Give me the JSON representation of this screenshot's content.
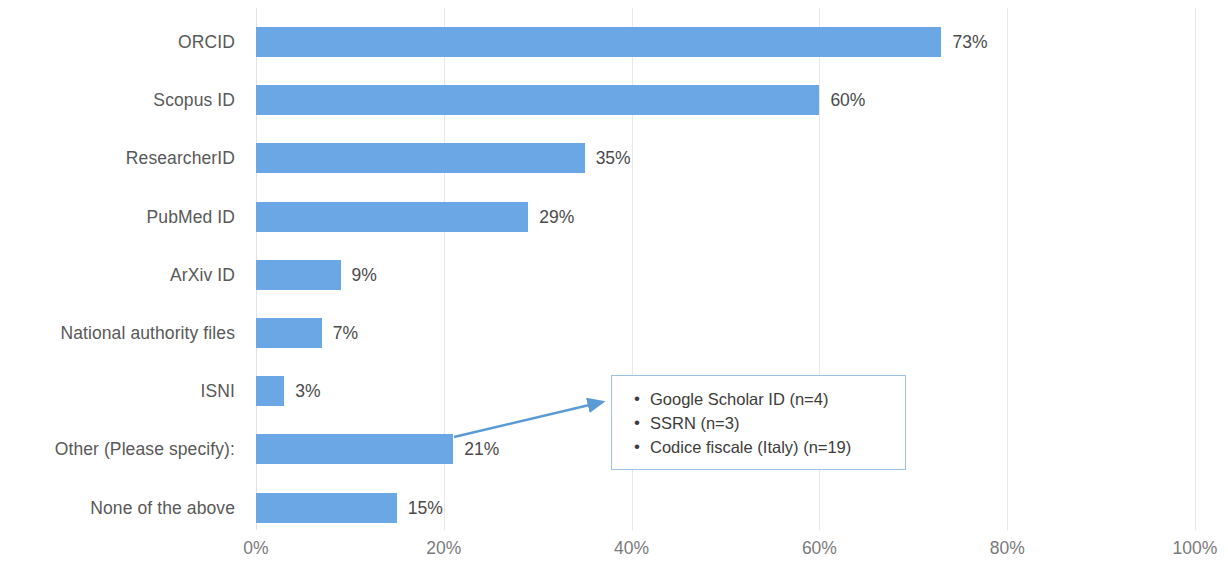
{
  "chart_data": {
    "type": "bar",
    "orientation": "horizontal",
    "title": "",
    "subtitle": "",
    "xlabel": "",
    "ylabel": "",
    "xlim": [
      0,
      100
    ],
    "xticks": [
      0,
      20,
      40,
      60,
      80,
      100
    ],
    "xtick_labels": [
      "0%",
      "20%",
      "40%",
      "60%",
      "80%",
      "100%"
    ],
    "grid": true,
    "grid_axis": "x",
    "legend": false,
    "value_label_suffix": "%",
    "bar_color": "#6BA7E5",
    "categories": [
      "ORCID",
      "Scopus ID",
      "ResearcherID",
      "PubMed ID",
      "ArXiv ID",
      "National authority files",
      "ISNI",
      "Other (Please specify):",
      "None of the above"
    ],
    "values": [
      73,
      60,
      35,
      29,
      9,
      7,
      3,
      21,
      15
    ],
    "value_labels": [
      "73%",
      "60%",
      "35%",
      "29%",
      "9%",
      "7%",
      "3%",
      "21%",
      "15%"
    ],
    "annotations": [
      {
        "type": "callout-box",
        "attached_to": "Other (Please specify):",
        "border_color": "#9CC3E5",
        "arrow_color": "#5B9BD5",
        "items": [
          "Google Scholar ID (n=4)",
          "SSRN (n=3)",
          "Codice fiscale (Italy) (n=19)"
        ]
      }
    ]
  },
  "axis": {
    "tick_labels": [
      "0%",
      "20%",
      "40%",
      "60%",
      "80%",
      "100%"
    ]
  },
  "callout": {
    "bullets": [
      "Google Scholar ID (n=4)",
      "SSRN (n=3)",
      "Codice fiscale (Italy) (n=19)"
    ]
  }
}
